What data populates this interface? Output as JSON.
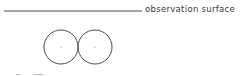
{
  "diagram": {
    "surface_label": "observation surface",
    "line_color": "#4a4a4a",
    "circles": [
      {
        "cx": 61,
        "cy": 47,
        "r": 17
      },
      {
        "cx": 95,
        "cy": 47,
        "r": 17
      }
    ]
  }
}
